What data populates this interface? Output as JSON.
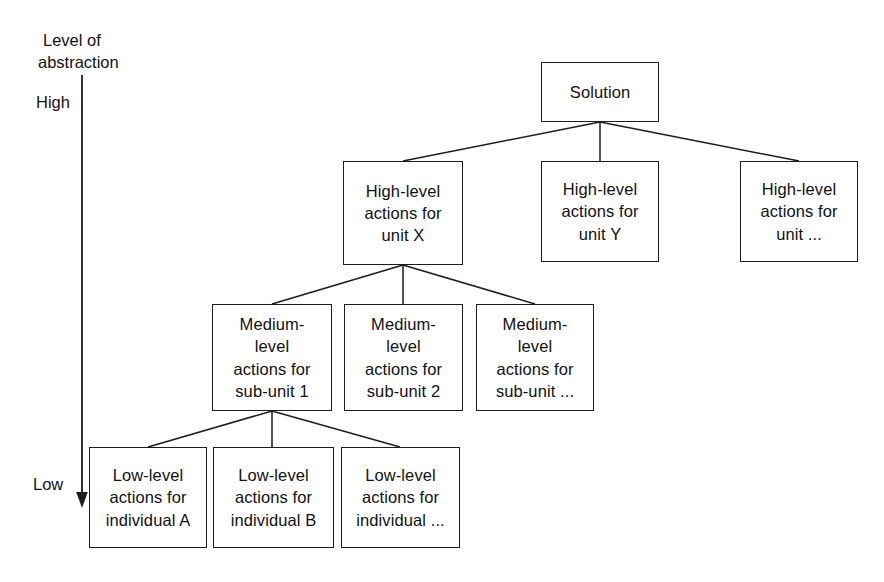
{
  "axis": {
    "title_line1": "Level of",
    "title_line2": "abstraction",
    "high_label": "High",
    "low_label": "Low",
    "direction": "downward-arrow",
    "stroke_color": "#1d1d1d"
  },
  "diagram": {
    "type": "tree",
    "stroke_color": "#1d1d1d",
    "fill_color": "#ffffff",
    "levels": [
      {
        "level": "root",
        "nodes": [
          {
            "id": "solution",
            "lines": [
              "Solution"
            ]
          }
        ]
      },
      {
        "level": "high",
        "nodes": [
          {
            "id": "high-x",
            "lines": [
              "High-level",
              "actions for",
              "unit X"
            ]
          },
          {
            "id": "high-y",
            "lines": [
              "High-level",
              "actions for",
              "unit Y"
            ]
          },
          {
            "id": "high-e",
            "lines": [
              "High-level",
              "actions for",
              "unit ..."
            ]
          }
        ]
      },
      {
        "level": "medium",
        "nodes": [
          {
            "id": "med-1",
            "lines": [
              "Medium-",
              "level",
              "actions for",
              "sub-unit 1"
            ]
          },
          {
            "id": "med-2",
            "lines": [
              "Medium-",
              "level",
              "actions for",
              "sub-unit 2"
            ]
          },
          {
            "id": "med-e",
            "lines": [
              "Medium-",
              "level",
              "actions for",
              "sub-unit ..."
            ]
          }
        ]
      },
      {
        "level": "low",
        "nodes": [
          {
            "id": "low-a",
            "lines": [
              "Low-level",
              "actions for",
              "individual A"
            ]
          },
          {
            "id": "low-b",
            "lines": [
              "Low-level",
              "actions for",
              "individual B"
            ]
          },
          {
            "id": "low-e",
            "lines": [
              "Low-level",
              "actions for",
              "individual ..."
            ]
          }
        ]
      }
    ],
    "edges": [
      {
        "from": "solution",
        "to": "high-x"
      },
      {
        "from": "solution",
        "to": "high-y"
      },
      {
        "from": "solution",
        "to": "high-e"
      },
      {
        "from": "high-x",
        "to": "med-1"
      },
      {
        "from": "high-x",
        "to": "med-2"
      },
      {
        "from": "high-x",
        "to": "med-e"
      },
      {
        "from": "med-1",
        "to": "low-a"
      },
      {
        "from": "med-1",
        "to": "low-b"
      },
      {
        "from": "med-1",
        "to": "low-e"
      }
    ]
  }
}
